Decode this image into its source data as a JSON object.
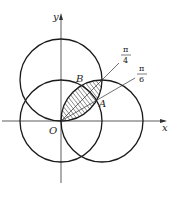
{
  "diagram": {
    "type": "polar-circles-region",
    "axes": {
      "x_label": "x",
      "y_label": "y",
      "origin_label": "O"
    },
    "points": {
      "A": "A",
      "B": "B"
    },
    "angle_labels": {
      "pi_over_4": {
        "numerator": "π",
        "denominator": "4"
      },
      "pi_over_6": {
        "numerator": "π",
        "denominator": "6"
      }
    },
    "circles": [
      {
        "name": "circle-centered-origin",
        "center": [
          0,
          0
        ],
        "radius": 1
      },
      {
        "name": "circle-centered-on-x-axis",
        "center": [
          1,
          0
        ],
        "radius": 1
      },
      {
        "name": "circle-centered-on-y-axis",
        "center": [
          0,
          1
        ],
        "radius": 1
      }
    ],
    "shaded_region": "lens between circle centered on x-axis and circle centered on y-axis",
    "colors": {
      "stroke": "#1a1a1a",
      "axis": "#333333",
      "background": "#ffffff"
    }
  }
}
